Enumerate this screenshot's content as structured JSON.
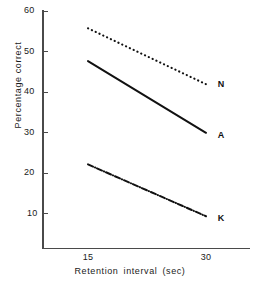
{
  "chart_data": {
    "type": "line",
    "title": "",
    "xlabel": "Retention interval (sec)",
    "ylabel": "Percentage correct",
    "x": [
      15,
      30
    ],
    "xlim": [
      10.2,
      36.0
    ],
    "ylim": [
      1.6,
      60.8
    ],
    "xticks": [
      15,
      30
    ],
    "xticklabels": [
      "15",
      "30"
    ],
    "yticks": [
      10,
      20,
      30,
      40,
      50,
      60
    ],
    "yticklabels": [
      "10",
      "20",
      "30",
      "40",
      "50",
      "60"
    ],
    "grid": false,
    "legend": "inline-right-end-labels",
    "series": [
      {
        "name": "N",
        "label": "N",
        "linestyle": "dotted",
        "color": "#111111",
        "values": [
          55.6,
          41.8
        ]
      },
      {
        "name": "A",
        "label": "A",
        "linestyle": "solid",
        "color": "#111111",
        "values": [
          47.5,
          29.8
        ]
      },
      {
        "name": "K",
        "label": "K",
        "linestyle": "dashdot",
        "color": "#111111",
        "values": [
          22.0,
          9.2
        ]
      }
    ],
    "annotations": [
      {
        "text": "N",
        "x": 31.5,
        "y": 41.8
      },
      {
        "text": "A",
        "x": 31.5,
        "y": 29.3
      },
      {
        "text": "K",
        "x": 31.5,
        "y": 8.8
      }
    ]
  },
  "axis": {
    "y_tick_labels": [
      "60",
      "50",
      "40",
      "30",
      "20",
      "10"
    ],
    "x_tick_labels": [
      "15",
      "30"
    ],
    "x_title": "Retention interval (sec)",
    "y_title": "Percentage correct"
  }
}
